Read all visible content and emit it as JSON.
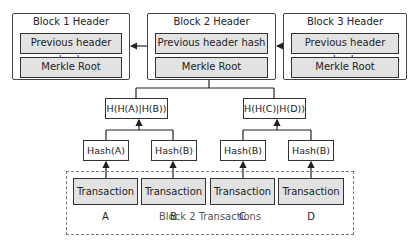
{
  "headers": [
    {
      "title": "Block 1 Header",
      "prev_hash": "Previous header hash",
      "merkle_root": "Merkle Root"
    },
    {
      "title": "Block 2 Header",
      "prev_hash": "Previous header hash",
      "merkle_root": "Merkle Root"
    },
    {
      "title": "Block 3 Header",
      "prev_hash": "Previous header hash",
      "merkle_root": "Merkle Root"
    }
  ],
  "tree": {
    "level1": [
      "H(H(A)|H(B))",
      "H(H(C)|H(D))"
    ],
    "level2": [
      "Hash(A)",
      "Hash(B)",
      "Hash(B)",
      "Hash(B)"
    ]
  },
  "transactions": {
    "items": [
      "Transaction A",
      "Transaction B",
      "Transaction C",
      "Transaction D"
    ],
    "group_label": "Block 2 Transactions"
  },
  "colors": {
    "field_fill": "#e2e2e2",
    "border": "#333333",
    "dashed_border": "#777777"
  }
}
